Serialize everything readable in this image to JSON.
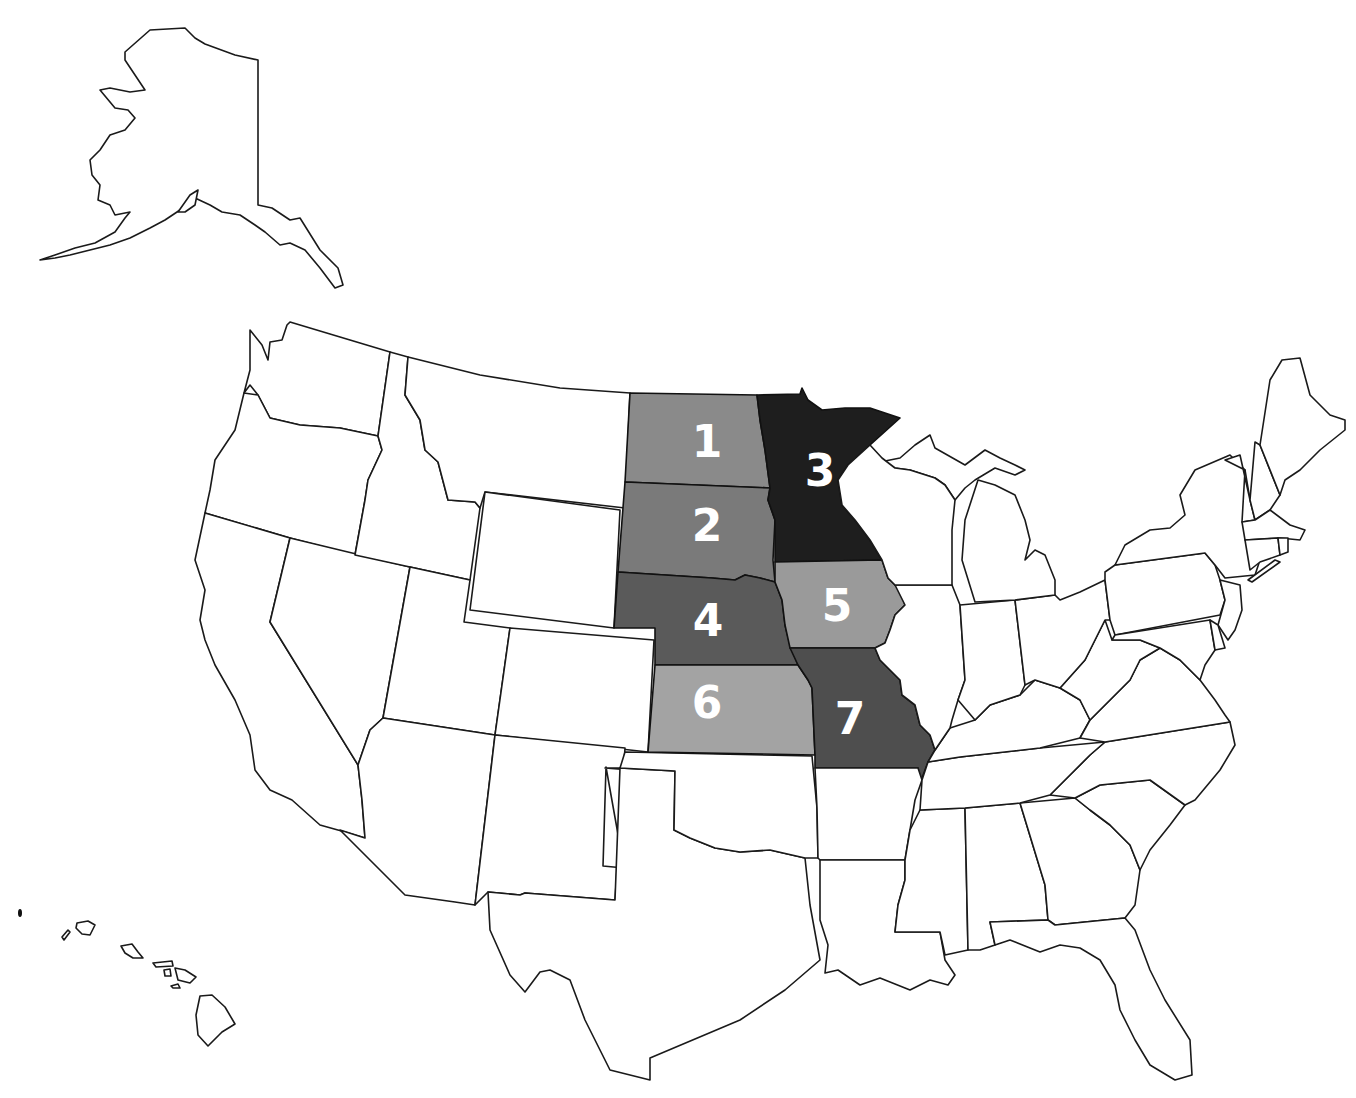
{
  "map": {
    "title": "United States map with seven highlighted Midwestern states",
    "region_colors": {
      "unshaded": "#ffffff",
      "border": "#1a1a1a",
      "label_text": "#ffffff"
    },
    "highlighted_states": [
      {
        "number": "1",
        "state": "North Dakota",
        "fill": "#8a8a8a"
      },
      {
        "number": "2",
        "state": "South Dakota",
        "fill": "#7a7a7a"
      },
      {
        "number": "3",
        "state": "Minnesota",
        "fill": "#1e1e1e"
      },
      {
        "number": "4",
        "state": "Nebraska",
        "fill": "#5a5a5a"
      },
      {
        "number": "5",
        "state": "Iowa",
        "fill": "#9a9a9a"
      },
      {
        "number": "6",
        "state": "Kansas",
        "fill": "#a3a3a3"
      },
      {
        "number": "7",
        "state": "Missouri",
        "fill": "#4e4e4e"
      }
    ],
    "insets": [
      "Alaska",
      "Hawaii"
    ]
  }
}
